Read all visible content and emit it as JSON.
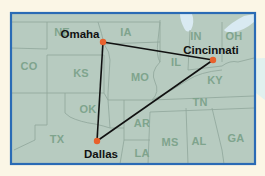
{
  "map": {
    "colors": {
      "page_background": "#fbf6e6",
      "land": "#b7cbc0",
      "state_border": "#8fa69a",
      "frame": "#2a6bb5",
      "water": "#d9eaf2",
      "route": "#111111",
      "city_dot": "#e8612c",
      "state_label": "#7fa48d",
      "callout": "#dff0ef"
    },
    "frame": {
      "x": 11,
      "y": 13,
      "width": 244,
      "height": 151
    },
    "states": [
      {
        "abbr": "NE",
        "x": 62,
        "y": 32
      },
      {
        "abbr": "IA",
        "x": 126,
        "y": 32
      },
      {
        "abbr": "IN",
        "x": 196,
        "y": 36
      },
      {
        "abbr": "OH",
        "x": 234,
        "y": 36
      },
      {
        "abbr": "CO",
        "x": 29,
        "y": 66
      },
      {
        "abbr": "KS",
        "x": 81,
        "y": 73
      },
      {
        "abbr": "IL",
        "x": 176,
        "y": 62
      },
      {
        "abbr": "MO",
        "x": 140,
        "y": 77
      },
      {
        "abbr": "KY",
        "x": 215,
        "y": 80
      },
      {
        "abbr": "OK",
        "x": 88,
        "y": 109
      },
      {
        "abbr": "TN",
        "x": 200,
        "y": 102
      },
      {
        "abbr": "AR",
        "x": 142,
        "y": 123
      },
      {
        "abbr": "TX",
        "x": 57,
        "y": 139
      },
      {
        "abbr": "MS",
        "x": 170,
        "y": 142
      },
      {
        "abbr": "AL",
        "x": 199,
        "y": 141
      },
      {
        "abbr": "GA",
        "x": 236,
        "y": 138
      },
      {
        "abbr": "LA",
        "x": 142,
        "y": 153
      }
    ],
    "cities": [
      {
        "name": "Omaha",
        "dot_x": 103,
        "dot_y": 42,
        "label_x": 80,
        "label_y": 34
      },
      {
        "name": "Cincinnati",
        "dot_x": 213,
        "dot_y": 60,
        "label_x": 211,
        "label_y": 50
      },
      {
        "name": "Dallas",
        "dot_x": 97,
        "dot_y": 141,
        "label_x": 101,
        "label_y": 154
      }
    ],
    "routes": [
      {
        "from": "Omaha",
        "to": "Cincinnati"
      },
      {
        "from": "Cincinnati",
        "to": "Dallas"
      },
      {
        "from": "Dallas",
        "to": "Omaha"
      }
    ]
  }
}
